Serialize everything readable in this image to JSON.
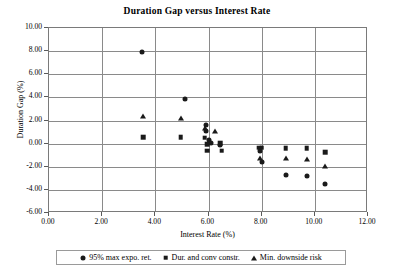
{
  "chart_data": {
    "type": "scatter",
    "title": "Duration Gap versus Interest Rate",
    "xlabel": "Interest Rate (%)",
    "ylabel": "Duration Gap (%)",
    "xlim": [
      0.0,
      12.0
    ],
    "ylim": [
      -6.0,
      10.0
    ],
    "xticks": [
      "0.00",
      "2.00",
      "4.00",
      "6.00",
      "8.00",
      "10.00",
      "12.00"
    ],
    "yticks": [
      "10.00",
      "8.00",
      "6.00",
      "4.00",
      "2.00",
      "0.00",
      "-2.00",
      "-4.00",
      "-6.00"
    ],
    "grid": true,
    "legend_position": "bottom",
    "series": [
      {
        "name": "95% max expo. ret.",
        "marker": "circle",
        "points": [
          [
            3.5,
            7.95
          ],
          [
            5.1,
            3.9
          ],
          [
            5.9,
            1.6
          ],
          [
            5.9,
            1.05
          ],
          [
            6.0,
            0.35
          ],
          [
            6.1,
            0.05
          ],
          [
            6.45,
            -0.1
          ],
          [
            7.95,
            -0.65
          ],
          [
            8.0,
            -1.55
          ],
          [
            8.9,
            -2.75
          ],
          [
            9.7,
            -2.8
          ],
          [
            10.4,
            -3.5
          ]
        ]
      },
      {
        "name": "Dur. and conv constr.",
        "marker": "square",
        "points": [
          [
            3.55,
            0.55
          ],
          [
            4.95,
            0.55
          ],
          [
            5.85,
            0.5
          ],
          [
            5.95,
            -0.05
          ],
          [
            5.95,
            -0.6
          ],
          [
            6.45,
            0.05
          ],
          [
            6.5,
            -0.6
          ],
          [
            7.9,
            -0.35
          ],
          [
            8.0,
            -0.35
          ],
          [
            8.9,
            -0.4
          ],
          [
            9.7,
            -0.4
          ],
          [
            10.4,
            -0.75
          ]
        ]
      },
      {
        "name": "Min. downside risk",
        "marker": "triangle",
        "points": [
          [
            3.55,
            2.35
          ],
          [
            4.95,
            2.25
          ],
          [
            5.85,
            1.35
          ],
          [
            6.25,
            1.1
          ],
          [
            7.95,
            -1.2
          ],
          [
            8.9,
            -1.25
          ],
          [
            9.7,
            -1.3
          ],
          [
            10.4,
            -1.95
          ]
        ]
      }
    ]
  },
  "legend": {
    "entries": [
      {
        "label": "95% max expo. ret.",
        "marker": "circle"
      },
      {
        "label": "Dur. and conv constr.",
        "marker": "square"
      },
      {
        "label": "Min. downside risk",
        "marker": "triangle"
      }
    ]
  }
}
